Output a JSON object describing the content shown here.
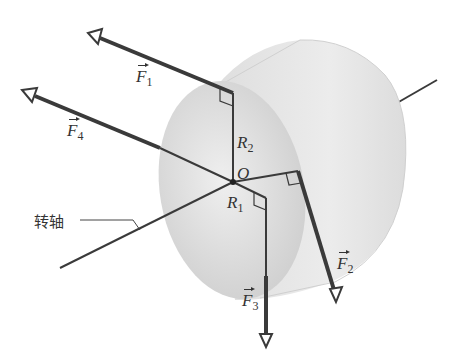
{
  "diagram": {
    "labels": {
      "F1": {
        "sym": "F",
        "sub": "1"
      },
      "F2": {
        "sym": "F",
        "sub": "2"
      },
      "F3": {
        "sym": "F",
        "sub": "3"
      },
      "F4": {
        "sym": "F",
        "sub": "4"
      },
      "R1": {
        "sym": "R",
        "sub": "1"
      },
      "R2": {
        "sym": "R",
        "sub": "2"
      },
      "O": "O",
      "axis": "转轴"
    },
    "colors": {
      "line": "#3a3a3a",
      "cylinder": "#e4e4e4",
      "face": "#d6d6d6"
    }
  }
}
